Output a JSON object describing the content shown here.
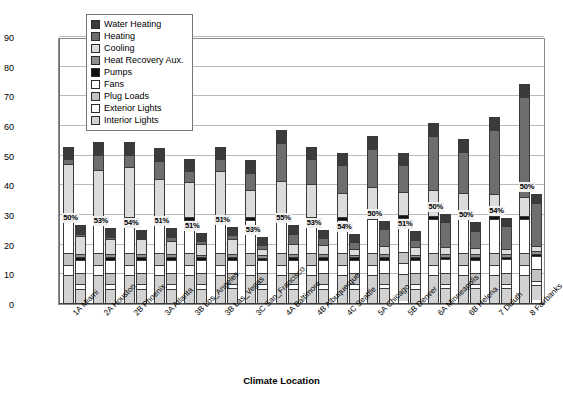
{
  "chart_data": {
    "type": "bar",
    "subtype": "stacked-grouped",
    "title": "",
    "xlabel": "Climate Location",
    "ylabel": "Site EUI (kBtu/sf/year)",
    "ylim": [
      0,
      90
    ],
    "ytick_step": 10,
    "yticks": [
      0,
      10,
      20,
      30,
      40,
      50,
      60,
      70,
      80,
      90
    ],
    "grid": true,
    "legend_position": "top-left-inside",
    "legend": [
      {
        "name": "Water Heating",
        "key": "water_heating",
        "swatch": "#3b3b3b"
      },
      {
        "name": "Heating",
        "key": "heating",
        "swatch": "#6e6e6e"
      },
      {
        "name": "Cooling",
        "key": "cooling",
        "swatch": "#dcdcdc"
      },
      {
        "name": "Heat Recovery Aux.",
        "key": "heat_recovery",
        "swatch": "#8f8f8f"
      },
      {
        "name": "Pumps",
        "key": "pumps",
        "swatch": "#111111"
      },
      {
        "name": "Fans",
        "key": "fans",
        "swatch": "#ffffff"
      },
      {
        "name": "Plug Loads",
        "key": "plug_loads",
        "swatch": "#c2c2c2"
      },
      {
        "name": "Exterior Lights",
        "key": "exterior_lights",
        "swatch": "#fdfdfd"
      },
      {
        "name": "Interior Lights",
        "key": "interior_lights",
        "swatch": "#d2d2d2"
      }
    ],
    "stack_order_bottom_to_top": [
      "interior_lights",
      "exterior_lights",
      "plug_loads",
      "fans",
      "pumps",
      "heat_recovery",
      "cooling",
      "heating",
      "water_heating"
    ],
    "categories": [
      "1A Miami",
      "2A Houston",
      "2B Phoenix",
      "3A Atlanta",
      "3B Los_Angeles",
      "3B Las_Vegas",
      "3C San_Francisco",
      "4A Baltimore",
      "4B Albuquerque",
      "4C Seattle",
      "5A Chicago",
      "5B Denver",
      "6A Minneapolis",
      "6B Helena",
      "7 Duluth",
      "8 Fairbanks"
    ],
    "savings_labels": [
      "50%",
      "53%",
      "54%",
      "51%",
      "51%",
      "51%",
      "53%",
      "55%",
      "53%",
      "54%",
      "50%",
      "51%",
      "50%",
      "50%",
      "54%",
      "50%"
    ],
    "bar_series": [
      {
        "name": "Baseline",
        "totals": [
          53.0,
          54.5,
          54.5,
          52.5,
          49.0,
          53.0,
          48.5,
          58.5,
          53.0,
          51.0,
          56.5,
          51.0,
          61.0,
          55.5,
          63.0,
          74.0
        ]
      },
      {
        "name": "Low Energy",
        "totals": [
          26.5,
          25.5,
          25.0,
          25.5,
          24.0,
          26.0,
          22.5,
          26.5,
          25.0,
          23.5,
          28.0,
          24.5,
          30.5,
          27.5,
          29.0,
          37.0
        ]
      }
    ],
    "baseline_stacks": [
      {
        "interior_lights": 9.5,
        "exterior_lights": 3.5,
        "plug_loads": 4.0,
        "fans": 11.5,
        "pumps": 1.0,
        "heat_recovery": 0.0,
        "cooling": 18.0,
        "heating": 1.5,
        "water_heating": 4.0
      },
      {
        "interior_lights": 9.5,
        "exterior_lights": 3.5,
        "plug_loads": 4.0,
        "fans": 11.5,
        "pumps": 1.0,
        "heat_recovery": 0.0,
        "cooling": 16.0,
        "heating": 5.0,
        "water_heating": 4.0
      },
      {
        "interior_lights": 9.5,
        "exterior_lights": 3.5,
        "plug_loads": 4.0,
        "fans": 11.5,
        "pumps": 1.0,
        "heat_recovery": 0.0,
        "cooling": 17.0,
        "heating": 4.0,
        "water_heating": 4.0
      },
      {
        "interior_lights": 9.5,
        "exterior_lights": 3.5,
        "plug_loads": 4.0,
        "fans": 11.5,
        "pumps": 1.0,
        "heat_recovery": 0.0,
        "cooling": 13.0,
        "heating": 6.0,
        "water_heating": 4.0
      },
      {
        "interior_lights": 9.5,
        "exterior_lights": 3.5,
        "plug_loads": 4.0,
        "fans": 11.5,
        "pumps": 1.0,
        "heat_recovery": 0.0,
        "cooling": 12.0,
        "heating": 3.5,
        "water_heating": 4.0
      },
      {
        "interior_lights": 9.5,
        "exterior_lights": 3.5,
        "plug_loads": 4.0,
        "fans": 11.5,
        "pumps": 1.0,
        "heat_recovery": 0.0,
        "cooling": 15.5,
        "heating": 4.0,
        "water_heating": 4.0
      },
      {
        "interior_lights": 9.5,
        "exterior_lights": 3.5,
        "plug_loads": 4.0,
        "fans": 11.5,
        "pumps": 1.0,
        "heat_recovery": 0.0,
        "cooling": 9.0,
        "heating": 6.0,
        "water_heating": 4.0
      },
      {
        "interior_lights": 9.5,
        "exterior_lights": 3.5,
        "plug_loads": 4.0,
        "fans": 11.5,
        "pumps": 1.0,
        "heat_recovery": 0.0,
        "cooling": 12.0,
        "heating": 13.0,
        "water_heating": 4.0
      },
      {
        "interior_lights": 9.5,
        "exterior_lights": 3.5,
        "plug_loads": 4.0,
        "fans": 11.5,
        "pumps": 1.0,
        "heat_recovery": 0.0,
        "cooling": 11.0,
        "heating": 8.5,
        "water_heating": 4.0
      },
      {
        "interior_lights": 9.5,
        "exterior_lights": 3.5,
        "plug_loads": 4.0,
        "fans": 11.5,
        "pumps": 1.0,
        "heat_recovery": 0.0,
        "cooling": 8.0,
        "heating": 9.5,
        "water_heating": 4.0
      },
      {
        "interior_lights": 9.5,
        "exterior_lights": 3.5,
        "plug_loads": 4.0,
        "fans": 11.5,
        "pumps": 1.0,
        "heat_recovery": 0.0,
        "cooling": 10.0,
        "heating": 13.0,
        "water_heating": 4.0
      },
      {
        "interior_lights": 9.5,
        "exterior_lights": 3.5,
        "plug_loads": 4.0,
        "fans": 11.5,
        "pumps": 1.0,
        "heat_recovery": 0.0,
        "cooling": 8.0,
        "heating": 9.0,
        "water_heating": 4.0
      },
      {
        "interior_lights": 9.5,
        "exterior_lights": 3.5,
        "plug_loads": 4.0,
        "fans": 11.5,
        "pumps": 1.0,
        "heat_recovery": 0.0,
        "cooling": 9.0,
        "heating": 18.5,
        "water_heating": 4.0
      },
      {
        "interior_lights": 9.5,
        "exterior_lights": 3.5,
        "plug_loads": 4.0,
        "fans": 11.5,
        "pumps": 1.0,
        "heat_recovery": 0.0,
        "cooling": 8.0,
        "heating": 14.0,
        "water_heating": 4.0
      },
      {
        "interior_lights": 9.5,
        "exterior_lights": 3.5,
        "plug_loads": 4.0,
        "fans": 11.5,
        "pumps": 1.0,
        "heat_recovery": 0.0,
        "cooling": 7.5,
        "heating": 22.0,
        "water_heating": 4.0
      },
      {
        "interior_lights": 9.5,
        "exterior_lights": 3.5,
        "plug_loads": 4.0,
        "fans": 11.5,
        "pumps": 1.0,
        "heat_recovery": 0.0,
        "cooling": 6.5,
        "heating": 34.0,
        "water_heating": 4.0
      }
    ],
    "lowenergy_stacks": [
      {
        "interior_lights": 5.0,
        "exterior_lights": 1.5,
        "plug_loads": 4.0,
        "fans": 4.5,
        "pumps": 0.8,
        "heat_recovery": 1.0,
        "cooling": 6.5,
        "heating": 0.7,
        "water_heating": 2.5
      },
      {
        "interior_lights": 5.0,
        "exterior_lights": 1.5,
        "plug_loads": 4.0,
        "fans": 4.5,
        "pumps": 0.8,
        "heat_recovery": 1.0,
        "cooling": 5.5,
        "heating": 0.7,
        "water_heating": 2.5
      },
      {
        "interior_lights": 5.0,
        "exterior_lights": 1.5,
        "plug_loads": 4.0,
        "fans": 4.5,
        "pumps": 0.8,
        "heat_recovery": 1.0,
        "cooling": 5.2,
        "heating": 0.5,
        "water_heating": 2.5
      },
      {
        "interior_lights": 5.0,
        "exterior_lights": 1.5,
        "plug_loads": 4.0,
        "fans": 4.5,
        "pumps": 0.8,
        "heat_recovery": 1.0,
        "cooling": 4.5,
        "heating": 1.7,
        "water_heating": 2.5
      },
      {
        "interior_lights": 5.0,
        "exterior_lights": 1.5,
        "plug_loads": 4.0,
        "fans": 4.5,
        "pumps": 0.8,
        "heat_recovery": 1.0,
        "cooling": 3.5,
        "heating": 1.2,
        "water_heating": 2.5
      },
      {
        "interior_lights": 5.0,
        "exterior_lights": 1.5,
        "plug_loads": 4.0,
        "fans": 4.5,
        "pumps": 0.8,
        "heat_recovery": 1.0,
        "cooling": 5.2,
        "heating": 1.5,
        "water_heating": 2.5
      },
      {
        "interior_lights": 5.0,
        "exterior_lights": 1.5,
        "plug_loads": 4.0,
        "fans": 4.5,
        "pumps": 0.8,
        "heat_recovery": 1.0,
        "cooling": 2.0,
        "heating": 1.2,
        "water_heating": 2.5
      },
      {
        "interior_lights": 5.0,
        "exterior_lights": 1.5,
        "plug_loads": 4.0,
        "fans": 4.5,
        "pumps": 0.8,
        "heat_recovery": 1.0,
        "cooling": 3.5,
        "heating": 3.7,
        "water_heating": 2.5
      },
      {
        "interior_lights": 5.0,
        "exterior_lights": 1.5,
        "plug_loads": 4.0,
        "fans": 4.5,
        "pumps": 0.8,
        "heat_recovery": 1.0,
        "cooling": 3.2,
        "heating": 2.5,
        "water_heating": 2.5
      },
      {
        "interior_lights": 5.0,
        "exterior_lights": 1.5,
        "plug_loads": 4.0,
        "fans": 4.5,
        "pumps": 0.8,
        "heat_recovery": 1.0,
        "cooling": 2.0,
        "heating": 2.2,
        "water_heating": 2.5
      },
      {
        "interior_lights": 5.0,
        "exterior_lights": 1.5,
        "plug_loads": 4.0,
        "fans": 4.5,
        "pumps": 0.8,
        "heat_recovery": 1.0,
        "cooling": 3.0,
        "heating": 5.7,
        "water_heating": 2.5
      },
      {
        "interior_lights": 5.0,
        "exterior_lights": 1.5,
        "plug_loads": 4.0,
        "fans": 4.5,
        "pumps": 0.8,
        "heat_recovery": 1.0,
        "cooling": 2.5,
        "heating": 2.7,
        "water_heating": 2.5
      },
      {
        "interior_lights": 5.0,
        "exterior_lights": 1.5,
        "plug_loads": 4.0,
        "fans": 4.5,
        "pumps": 0.8,
        "heat_recovery": 1.0,
        "cooling": 2.5,
        "heating": 8.7,
        "water_heating": 2.5
      },
      {
        "interior_lights": 5.0,
        "exterior_lights": 1.5,
        "plug_loads": 4.0,
        "fans": 4.5,
        "pumps": 0.8,
        "heat_recovery": 1.0,
        "cooling": 2.2,
        "heating": 6.0,
        "water_heating": 2.5
      },
      {
        "interior_lights": 5.0,
        "exterior_lights": 1.5,
        "plug_loads": 4.0,
        "fans": 4.5,
        "pumps": 0.8,
        "heat_recovery": 1.0,
        "cooling": 2.0,
        "heating": 7.7,
        "water_heating": 2.5
      },
      {
        "interior_lights": 5.0,
        "exterior_lights": 1.5,
        "plug_loads": 4.0,
        "fans": 4.5,
        "pumps": 0.8,
        "heat_recovery": 1.0,
        "cooling": 1.8,
        "heating": 14.9,
        "water_heating": 2.5
      }
    ]
  }
}
